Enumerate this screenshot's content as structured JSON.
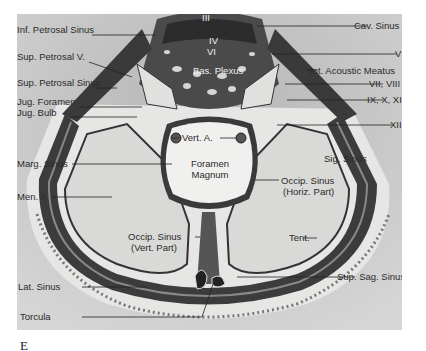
{
  "figure": {
    "letter": "E",
    "labels": {
      "inf_petrosal_sinus": "Inf. Petrosal Sinus",
      "sup_petrosal_v": "Sup. Petrosal V.",
      "sup_petrosal_sinus": "Sup. Petrosal Sinus",
      "jug_foramen": "Jug. Foramen",
      "jug_bulb": "Jug. Bulb",
      "marg_sinus": "Marg. Sinus",
      "men_a": "Men. A",
      "cav_sinus": "Cav. Sinus",
      "nerve_v": "V",
      "int_acoustic_meatus": "Int. Acoustic Meatus",
      "nerve_vii_viii": "VII, VIII",
      "nerve_ix_x_xi": "IX, X, XI",
      "nerve_xii": "XII",
      "nerve_iii": "III",
      "nerve_iv": "IV",
      "nerve_vi": "VI",
      "bas_plexus": "Bas. Plexus",
      "vert_a": "Vert. A.",
      "foramen_magnum_1": "Foramen",
      "foramen_magnum_2": "Magnum",
      "sig_sinus": "Sig. Sinus",
      "occip_sinus_horiz_1": "Occip. Sinus",
      "occip_sinus_horiz_2": "(Horiz. Part)",
      "tent": "Tent.",
      "occip_sinus_vert_1": "Occip. Sinus",
      "occip_sinus_vert_2": "(Vert. Part)",
      "lat_sinus": "Lat. Sinus",
      "sup_sag_sinus": "Sup. Sag. Sinus",
      "torcula": "Torcula"
    }
  },
  "colors": {
    "background": "#c9c9c9",
    "fossa": "#d8d8d6",
    "sinus_dark": "#3a3a3a",
    "dura": "#9a9a9a",
    "foramen": "#f0f0ee"
  }
}
